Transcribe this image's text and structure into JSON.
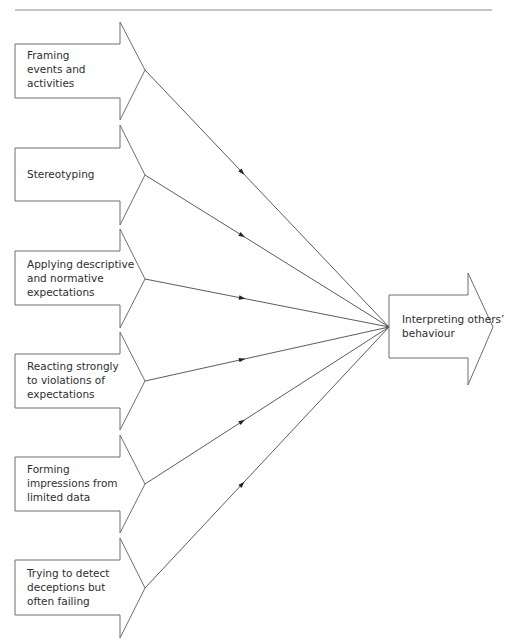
{
  "diagram": {
    "type": "convergence-flow",
    "header_rule": true,
    "sources": [
      {
        "id": "framing",
        "label": "Framing\nevents and\nactivities",
        "tip_y": 70,
        "box_top": 44,
        "box_bottom": 98,
        "head_top": 22,
        "head_bottom": 120,
        "marker": [
          241,
          184
        ]
      },
      {
        "id": "stereotyping",
        "label": "Stereotyping",
        "tip_y": 175,
        "box_top": 148,
        "box_bottom": 201,
        "head_top": 125,
        "head_bottom": 225,
        "marker": [
          242,
          244
        ]
      },
      {
        "id": "applying",
        "label": "Applying descriptive\nand normative\nexpectations",
        "tip_y": 279,
        "box_top": 251,
        "box_bottom": 305,
        "head_top": 229,
        "head_bottom": 328,
        "marker": [
          242,
          301
        ]
      },
      {
        "id": "reacting",
        "label": "Reacting strongly\nto violations of\nexpectations",
        "tip_y": 381,
        "box_top": 354,
        "box_bottom": 408,
        "head_top": 332,
        "head_bottom": 430,
        "marker": [
          242,
          358
        ]
      },
      {
        "id": "forming",
        "label": "Forming\nimpressions from\nlimited data",
        "tip_y": 484,
        "box_top": 457,
        "box_bottom": 511,
        "head_top": 435,
        "head_bottom": 533,
        "marker": [
          242,
          414
        ]
      },
      {
        "id": "trying",
        "label": "Trying to detect\ndeceptions but\noften failing",
        "tip_y": 588,
        "box_top": 560,
        "box_bottom": 615,
        "head_top": 538,
        "head_bottom": 638,
        "marker": [
          242,
          471
        ]
      }
    ],
    "target": {
      "id": "interpreting",
      "label": "Interpreting others’\nbehaviour",
      "convergence_point": [
        389,
        327
      ]
    },
    "colors": {
      "stroke": "#6e6e6e",
      "line": "#4a4a4a",
      "text": "#2e2e2e",
      "rule": "#8a8a8a"
    }
  }
}
